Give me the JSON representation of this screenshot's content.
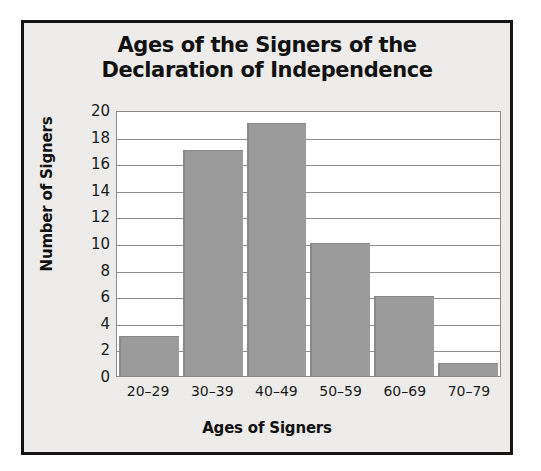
{
  "chart_data": {
    "type": "bar",
    "title": "Ages of the Signers of the Declaration of Independence",
    "title_lines": [
      "Ages of the Signers of the",
      "Declaration of Independence"
    ],
    "xlabel": "Ages of Signers",
    "ylabel": "Number of Signers",
    "categories": [
      "20–29",
      "30–39",
      "40–49",
      "50–59",
      "60–69",
      "70–79"
    ],
    "values": [
      3,
      17,
      19,
      10,
      6,
      1
    ],
    "ylim": [
      0,
      20
    ],
    "ytick_values": [
      0,
      2,
      4,
      6,
      8,
      10,
      12,
      14,
      16,
      18,
      20
    ],
    "ytick_labels": [
      "0",
      "2",
      "4",
      "6",
      "8",
      "10",
      "12",
      "14",
      "16",
      "18",
      "20"
    ],
    "grid": "horizontal",
    "legend": "none",
    "bar_color": "#9b9b9b",
    "plot_background": "#ffffff",
    "figure_background": "#eeecea",
    "frame_color": "#151515",
    "text_color": "#111111"
  }
}
